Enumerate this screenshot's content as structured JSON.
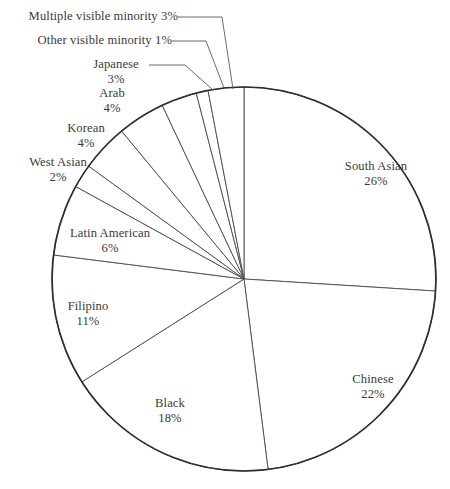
{
  "chart_data": {
    "type": "pie",
    "title": "",
    "subtitle": "",
    "xlabel": "",
    "ylabel": "",
    "legend_position": "none",
    "grid": false,
    "value_unit": "percent",
    "start_angle_deg": 0,
    "direction": "clockwise",
    "categories": [
      "South Asian",
      "Chinese",
      "Black",
      "Filipino",
      "Latin American",
      "West Asian",
      "Korean",
      "Arab",
      "Japanese",
      "Other visible minority",
      "Multiple visible minority"
    ],
    "values": [
      26,
      22,
      18,
      11,
      6,
      2,
      4,
      4,
      3,
      1,
      3
    ],
    "labels": [
      "South Asian 26%",
      "Chinese 22%",
      "Black 18%",
      "Filipino 11%",
      "Latin American 6%",
      "West Asian 2%",
      "Korean 4%",
      "Arab 4%",
      "Japanese 3%",
      "Other visible minority 1%",
      "Multiple visible minority 3%"
    ],
    "total": 100
  },
  "slices": [
    {
      "name": "South Asian",
      "percent_text": "26%",
      "value": 26
    },
    {
      "name": "Chinese",
      "percent_text": "22%",
      "value": 22
    },
    {
      "name": "Black",
      "percent_text": "18%",
      "value": 18
    },
    {
      "name": "Filipino",
      "percent_text": "11%",
      "value": 11
    },
    {
      "name": "Latin American",
      "percent_text": "6%",
      "value": 6
    },
    {
      "name": "West Asian",
      "percent_text": "2%",
      "value": 2
    },
    {
      "name": "Korean",
      "percent_text": "4%",
      "value": 4
    },
    {
      "name": "Arab",
      "percent_text": "4%",
      "value": 4
    },
    {
      "name": "Japanese",
      "percent_text": "3%",
      "value": 3
    },
    {
      "name": "Other visible minority",
      "percent_text": "1%",
      "value": 1
    },
    {
      "name": "Multiple visible minority",
      "percent_text": "3%",
      "value": 3
    }
  ],
  "style": {
    "background": "#ffffff",
    "text_color": "#3a3a3a",
    "outline_color": "#2e2e2e",
    "divider_color": "#4a4a4a",
    "slice_fill": "#ffffff"
  },
  "geometry": {
    "center_x": 244,
    "center_y": 279,
    "radius": 192
  }
}
